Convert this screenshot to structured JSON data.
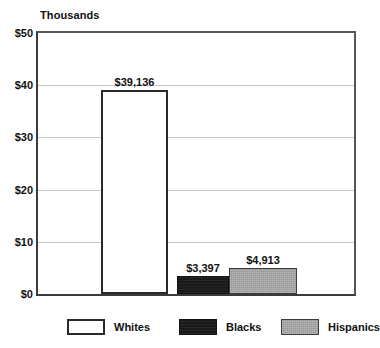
{
  "chart_data": {
    "type": "bar",
    "title": "",
    "subtitle": "",
    "axis_note": "Thousands",
    "xlabel": "",
    "ylabel": "",
    "ylim": [
      0,
      50
    ],
    "ytick_values": [
      0,
      10,
      20,
      30,
      40,
      50
    ],
    "ytick_labels": [
      "$0",
      "$10",
      "$20",
      "$30",
      "$40",
      "$50"
    ],
    "grid": true,
    "grid_axis": "y",
    "legend_position": "bottom",
    "units": "thousands of dollars",
    "categories": [
      "Whites",
      "Blacks",
      "Hispanics"
    ],
    "values": [
      39.136,
      3.397,
      4.913
    ],
    "data_labels": [
      "$39,136",
      "$3,397",
      "$4,913"
    ],
    "series": [
      {
        "name": "Median net worth",
        "values": [
          39.136,
          3.397,
          4.913
        ],
        "labels": [
          "$39,136",
          "$3,397",
          "$4,913"
        ]
      }
    ],
    "bars": [
      {
        "category": "Whites",
        "value": 39.136,
        "label": "$39,136",
        "fill": "#ffffff",
        "border": "#2a2a2a",
        "left_px": 101,
        "width_px": 67
      },
      {
        "category": "Blacks",
        "value": 3.397,
        "label": "$3,397",
        "fill": "#1a1a1a",
        "border": "#111111",
        "left_px": 177,
        "width_px": 52
      },
      {
        "category": "Hispanics",
        "value": 4.913,
        "label": "$4,913",
        "fill": "#989898",
        "border": "#3c3c3c",
        "left_px": 229,
        "width_px": 68
      }
    ],
    "legend": [
      {
        "label": "Whites",
        "fill": "#ffffff",
        "swatch": "swatch-whites"
      },
      {
        "label": "Blacks",
        "fill": "#1a1a1a",
        "swatch": "swatch-blacks"
      },
      {
        "label": "Hispanics",
        "fill": "#989898",
        "swatch": "swatch-hispanics"
      }
    ],
    "colors": {
      "axis": "#3b3b3b",
      "grid": "#c9c9c9",
      "text": "#111111",
      "background": "#ffffff"
    }
  }
}
